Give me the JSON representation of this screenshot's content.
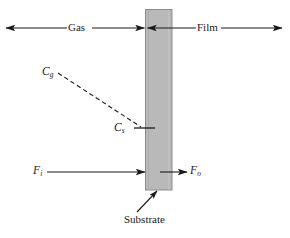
{
  "figure": {
    "width": 290,
    "height": 238,
    "background": "#ffffff",
    "type": "schematic-diagram"
  },
  "slab": {
    "name": "substrate-slab",
    "x": 145,
    "y": 9,
    "width": 27,
    "height": 181,
    "fill": "#b9b9b9",
    "stroke": "#8a8a8a"
  },
  "colors": {
    "ink": "#1a1a1a",
    "slab_fill": "#b9b9b9",
    "slab_edge": "#8a8a8a",
    "background": "#ffffff"
  },
  "labels": {
    "gas": "Gas",
    "film": "Film",
    "substrate": "Substrate",
    "c_gas": "C",
    "c_gas_sub": "g",
    "c_surface": "C",
    "c_surface_sub": "s",
    "flux_in": "F",
    "flux_in_sub": "i",
    "flux_out": "F",
    "flux_out_sub": "o"
  },
  "arrows": {
    "gas_region": {
      "name": "gas-double-arrow",
      "y": 28,
      "x_left": 5,
      "x_right": 145,
      "heads": "both",
      "label": "Gas"
    },
    "film_region": {
      "name": "film-double-arrow",
      "y": 28,
      "x_left": 146,
      "x_right": 283,
      "heads": "both",
      "label": "Film"
    },
    "flux_in": {
      "name": "flux-in-arrow",
      "y": 172,
      "x_start": 47,
      "x_end": 145,
      "heads": "right",
      "label": "F_i"
    },
    "flux_out": {
      "name": "flux-out-arrow",
      "y": 172,
      "x_start": 160,
      "x_end": 188,
      "heads": "right",
      "label": "F_o"
    },
    "substrate_leader": {
      "name": "substrate-leader-arrow",
      "x_start": 138,
      "y_start": 213,
      "x_end": 157,
      "y_end": 191,
      "heads": "end",
      "label": "Substrate"
    }
  },
  "curves": {
    "concentration_profile": {
      "name": "concentration-dashed-line",
      "style": "dashed",
      "from": {
        "x": 58,
        "y": 74
      },
      "to": {
        "x": 142,
        "y": 128
      },
      "from_label": "C_g",
      "to_label": "C_s"
    },
    "surface_tick": {
      "name": "surface-concentration-tick",
      "x_start": 133,
      "x_end": 155,
      "y": 128
    }
  }
}
